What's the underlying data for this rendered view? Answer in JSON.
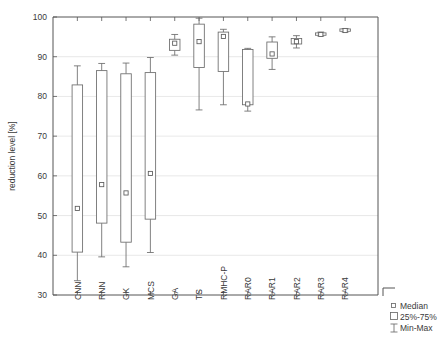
{
  "chart_data": {
    "type": "boxplot",
    "title": "",
    "xlabel": "",
    "ylabel": "reduction level [%]",
    "ylim": [
      30,
      100
    ],
    "yticks": [
      30,
      40,
      50,
      60,
      70,
      80,
      90,
      100
    ],
    "grid": true,
    "categories": [
      "CNN",
      "RNN",
      "GK",
      "MCS",
      "GA",
      "TS",
      "RMHC-P",
      "RAR0",
      "RAR1",
      "RAR2",
      "RAR3",
      "RAR4"
    ],
    "legend": {
      "position": "outside-right-bottom",
      "entries": [
        {
          "label": "Median",
          "marker": "small-square"
        },
        {
          "label": "25%-75%",
          "marker": "box"
        },
        {
          "label": "Min-Max",
          "marker": "i-beam"
        }
      ]
    },
    "boxes": [
      {
        "category": "CNN",
        "min": 33.6,
        "q1": 40.8,
        "median": 51.8,
        "q3": 82.9,
        "max": 87.7
      },
      {
        "category": "RNN",
        "min": 39.6,
        "q1": 48.1,
        "median": 57.8,
        "q3": 86.5,
        "max": 88.3
      },
      {
        "category": "GK",
        "min": 37.1,
        "q1": 43.3,
        "median": 55.7,
        "q3": 85.7,
        "max": 88.4
      },
      {
        "category": "MCS",
        "min": 40.7,
        "q1": 49.1,
        "median": 60.6,
        "q3": 86.0,
        "max": 89.8
      },
      {
        "category": "GA",
        "min": 90.4,
        "q1": 91.6,
        "median": 93.4,
        "q3": 94.4,
        "max": 95.6
      },
      {
        "category": "TS",
        "min": 76.6,
        "q1": 87.3,
        "median": 93.8,
        "q3": 98.2,
        "max": 99.7
      },
      {
        "category": "RMHC-P",
        "min": 77.9,
        "q1": 86.3,
        "median": 95.1,
        "q3": 96.2,
        "max": 96.9
      },
      {
        "category": "RAR0",
        "min": 76.3,
        "q1": 77.9,
        "median": 78.1,
        "q3": 91.8,
        "max": 92.1
      },
      {
        "category": "RAR1",
        "min": 86.8,
        "q1": 89.6,
        "median": 90.7,
        "q3": 93.7,
        "max": 95.0
      },
      {
        "category": "RAR2",
        "min": 92.2,
        "q1": 93.2,
        "median": 93.8,
        "q3": 94.6,
        "max": 95.3
      },
      {
        "category": "RAR3",
        "min": 95.2,
        "q1": 95.4,
        "median": 95.6,
        "q3": 96.0,
        "max": 96.2
      },
      {
        "category": "RAR4",
        "min": 96.2,
        "q1": 96.4,
        "median": 96.6,
        "q3": 97.0,
        "max": 97.1
      }
    ]
  },
  "figure": {
    "ylabel": "reduction level [%]",
    "caption": ""
  },
  "colors": {
    "axis": "#555555",
    "grid": "#d8d8d8",
    "box_stroke": "#6b6b6b",
    "background": "#ffffff",
    "text": "#3a3a3a"
  }
}
